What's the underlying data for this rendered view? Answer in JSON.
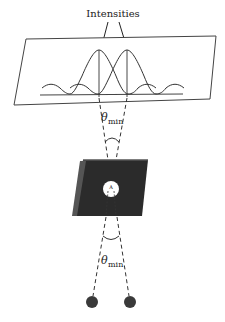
{
  "diagram": {
    "title_label": "Intensities",
    "angle_symbol": "θ",
    "angle_subscript": "min",
    "upper_angle_label": "θmin",
    "lower_angle_label": "θmin",
    "aperture_label": "A",
    "components": [
      {
        "name": "screen",
        "description": "Observation screen showing two overlapping diffraction intensity patterns"
      },
      {
        "name": "aperture-plate",
        "description": "Opaque plate with circular aperture"
      },
      {
        "name": "point-sources",
        "count": 2
      }
    ],
    "colors": {
      "line": "#333333",
      "plate": "#2b2b2b",
      "plate_edge": "#5a5a5a",
      "source": "#3a3a3a",
      "aperture": "#ffffff"
    }
  }
}
